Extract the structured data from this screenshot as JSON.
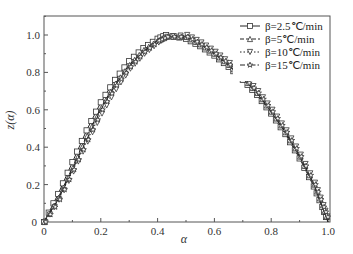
{
  "chart_data": {
    "type": "line",
    "title": "",
    "xlabel": "α",
    "ylabel": "z(α)",
    "xlim": [
      0,
      1.0
    ],
    "ylim": [
      0,
      1.1
    ],
    "grid": false,
    "legend_position": "upper right",
    "x_ticks": [
      "0",
      "0.2",
      "0.4",
      "0.6",
      "0.8",
      "1.0"
    ],
    "y_ticks": [
      "0",
      "0.2",
      "0.4",
      "0.6",
      "0.8",
      "1.0"
    ],
    "x": [
      0,
      0.05,
      0.1,
      0.15,
      0.2,
      0.25,
      0.3,
      0.35,
      0.4,
      0.43,
      0.5,
      0.55,
      0.6,
      0.65,
      0.7,
      0.75,
      0.8,
      0.85,
      0.9,
      0.95,
      0.98,
      1.0
    ],
    "series": [
      {
        "name": "β=2.5℃/min",
        "marker": "square",
        "dash": "solid",
        "values": [
          0,
          0.15,
          0.32,
          0.49,
          0.64,
          0.76,
          0.86,
          0.93,
          0.98,
          1.0,
          0.98,
          0.94,
          0.89,
          0.83,
          0.76,
          0.68,
          0.58,
          0.47,
          0.34,
          0.19,
          0.08,
          0
        ]
      },
      {
        "name": "β=5℃/min",
        "marker": "triangle-up",
        "dash": "dashed",
        "values": [
          0,
          0.13,
          0.29,
          0.46,
          0.61,
          0.74,
          0.84,
          0.92,
          0.97,
          0.99,
          0.99,
          0.95,
          0.9,
          0.84,
          0.77,
          0.69,
          0.59,
          0.48,
          0.35,
          0.2,
          0.09,
          0
        ]
      },
      {
        "name": "β=10℃/min",
        "marker": "triangle-down",
        "dash": "dotted",
        "values": [
          0,
          0.12,
          0.27,
          0.43,
          0.58,
          0.71,
          0.82,
          0.9,
          0.96,
          0.99,
          1.0,
          0.96,
          0.91,
          0.85,
          0.78,
          0.7,
          0.6,
          0.49,
          0.36,
          0.21,
          0.09,
          0
        ]
      },
      {
        "name": "β=15℃/min",
        "marker": "star",
        "dash": "dashdot",
        "values": [
          0,
          0.12,
          0.28,
          0.44,
          0.6,
          0.73,
          0.83,
          0.91,
          0.97,
          0.99,
          0.99,
          0.95,
          0.9,
          0.84,
          0.77,
          0.69,
          0.59,
          0.48,
          0.35,
          0.2,
          0.08,
          0
        ]
      }
    ]
  },
  "legend": {
    "items": [
      {
        "label": "β=2.5℃/min"
      },
      {
        "label": "β=5℃/min"
      },
      {
        "label": "β=10℃/min"
      },
      {
        "label": "β=15℃/min"
      }
    ]
  },
  "axes": {
    "xlabel": "α",
    "ylabel": "z(α)",
    "origin_y": "0",
    "origin_x": "0"
  }
}
